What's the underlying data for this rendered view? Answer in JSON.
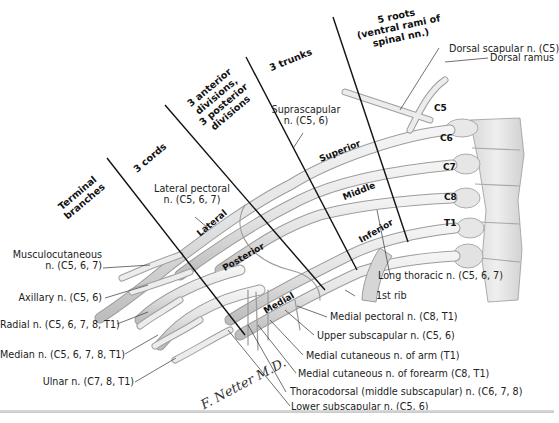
{
  "figure": {
    "signature": "F. Netter M.D."
  },
  "headers": [
    {
      "id": "terminal",
      "lines": [
        "Terminal",
        "branches"
      ]
    },
    {
      "id": "cords",
      "lines": [
        "3 cords"
      ]
    },
    {
      "id": "divisions",
      "lines": [
        "3 anterior",
        "divisions,",
        "3 posterior",
        "divisions"
      ]
    },
    {
      "id": "trunks",
      "lines": [
        "3 trunks"
      ]
    },
    {
      "id": "roots",
      "lines": [
        "5 roots",
        "(ventral rami of",
        "spinal nn.)"
      ]
    }
  ],
  "segments": {
    "superior": "Superior",
    "middle": "Middle",
    "inferior": "Inferior",
    "lateral": "Lateral",
    "posterior": "Posterior",
    "medial": "Medial"
  },
  "roots": [
    "C5",
    "C6",
    "C7",
    "C8",
    "T1"
  ],
  "labels_left": [
    {
      "lines": [
        "Musculocutaneous",
        "n. (C5, 6, 7)"
      ]
    },
    {
      "lines": [
        "Axillary n. (C5, 6)"
      ]
    },
    {
      "lines": [
        "Radial n. (C5, 6, 7, 8, T1)"
      ]
    },
    {
      "lines": [
        "Median n. (C5, 6, 7, 8, T1)"
      ]
    },
    {
      "lines": [
        "Ulnar n. (C7, 8, T1)"
      ]
    }
  ],
  "labels_top": {
    "lateral_pectoral": [
      "Lateral pectoral",
      "n. (C5, 6, 7)"
    ],
    "suprascapular": [
      "Suprascapular",
      "n. (C5, 6)"
    ],
    "dorsal_scapular": "Dorsal scapular n. (C5)",
    "dorsal_ramus": "Dorsal ramus"
  },
  "labels_right": [
    {
      "text": "Long thoracic n. (C5, 6, 7)"
    },
    {
      "text": "1st rib"
    },
    {
      "text": "Medial pectoral n. (C8, T1)"
    },
    {
      "text": "Upper subscapular n. (C5, 6)"
    },
    {
      "text": "Medial cutaneous n. of arm (T1)"
    },
    {
      "text": "Medial cutaneous n. of forearm (C8, T1)"
    },
    {
      "text": "Thoracodorsal (middle subscapular) n. (C6, 7, 8)"
    },
    {
      "text": "Lower subscapular n. (C5, 6)"
    }
  ]
}
